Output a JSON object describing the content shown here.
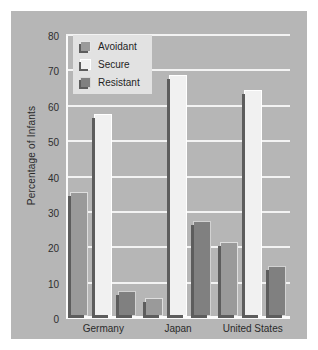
{
  "chart_data": {
    "type": "bar",
    "title": "",
    "xlabel": "",
    "ylabel": "Percentage of Infants",
    "categories": [
      "Germany",
      "Japan",
      "United States"
    ],
    "series": [
      {
        "name": "Avoidant",
        "values": [
          35,
          5,
          21
        ],
        "color": "#9a9a9a"
      },
      {
        "name": "Secure",
        "values": [
          57,
          68,
          64
        ],
        "color": "#f1f1f1"
      },
      {
        "name": "Resistant",
        "values": [
          7,
          27,
          14
        ],
        "color": "#808080"
      }
    ],
    "ylim": [
      0,
      80
    ],
    "yticks": [
      0,
      10,
      20,
      30,
      40,
      50,
      60,
      70,
      80
    ],
    "ytick_labels": [
      "0",
      "10",
      "20",
      "30",
      "40",
      "50",
      "60",
      "70",
      "80"
    ],
    "grid": true,
    "grid_color": "#f3f3f3",
    "legend_position": "top-left",
    "plot_background": "#b6b6b6",
    "figure_background": "#ffffff"
  }
}
